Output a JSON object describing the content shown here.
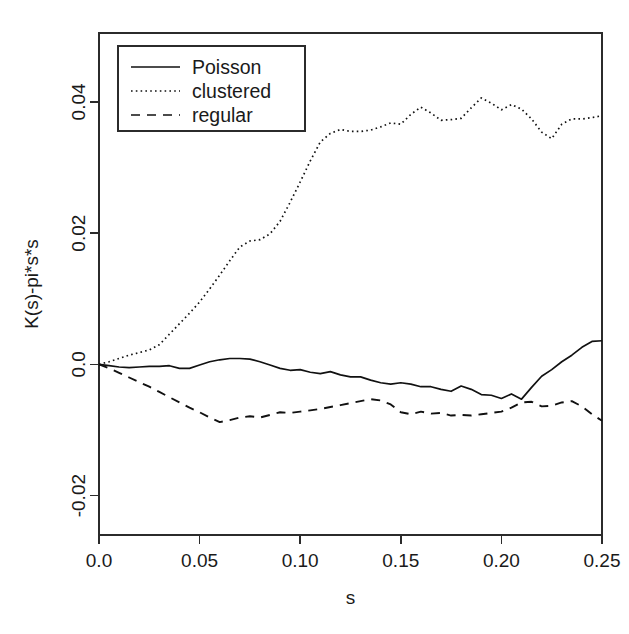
{
  "chart_data": {
    "type": "line",
    "title": "",
    "xlabel": "s",
    "ylabel": "K(s)-pi*s*s",
    "xlim": [
      0.0,
      0.25
    ],
    "ylim": [
      -0.026,
      0.0505
    ],
    "grid": false,
    "legend_position": "top-left",
    "xticks": [
      0.0,
      0.05,
      0.1,
      0.15,
      0.2,
      0.25
    ],
    "xticklabels": [
      "0.0",
      "0.05",
      "0.10",
      "0.15",
      "0.20",
      "0.25"
    ],
    "yticks": [
      -0.02,
      0.0,
      0.02,
      0.04
    ],
    "yticklabels": [
      "-0.02",
      "0.0",
      "0.02",
      "0.04"
    ],
    "series": [
      {
        "name": "Poisson",
        "style": "solid",
        "color": "#111111",
        "x": [
          0.0,
          0.005,
          0.01,
          0.015,
          0.02,
          0.025,
          0.03,
          0.035,
          0.04,
          0.045,
          0.05,
          0.055,
          0.06,
          0.065,
          0.07,
          0.075,
          0.08,
          0.085,
          0.09,
          0.095,
          0.1,
          0.105,
          0.11,
          0.115,
          0.12,
          0.125,
          0.13,
          0.135,
          0.14,
          0.145,
          0.15,
          0.155,
          0.16,
          0.165,
          0.17,
          0.175,
          0.18,
          0.185,
          0.19,
          0.195,
          0.2,
          0.205,
          0.21,
          0.215,
          0.22,
          0.225,
          0.23,
          0.235,
          0.24,
          0.245,
          0.25
        ],
        "y": [
          0.0,
          -0.0002,
          -0.0004,
          -0.0005,
          -0.0004,
          -0.0003,
          -0.0003,
          -0.0002,
          -0.0006,
          -0.0006,
          -0.0001,
          0.0004,
          0.0007,
          0.0009,
          0.0009,
          0.0008,
          0.0004,
          -0.0001,
          -0.0006,
          -0.0009,
          -0.0008,
          -0.0012,
          -0.0014,
          -0.0011,
          -0.0016,
          -0.0019,
          -0.0019,
          -0.0024,
          -0.0028,
          -0.003,
          -0.0028,
          -0.003,
          -0.0034,
          -0.0034,
          -0.0038,
          -0.0041,
          -0.0033,
          -0.0038,
          -0.0046,
          -0.0047,
          -0.0052,
          -0.0045,
          -0.0053,
          -0.0035,
          -0.0018,
          -0.0008,
          0.0004,
          0.0014,
          0.0026,
          0.0035,
          0.0036
        ]
      },
      {
        "name": "clustered",
        "style": "dotted",
        "color": "#111111",
        "x": [
          0.0,
          0.005,
          0.01,
          0.015,
          0.02,
          0.025,
          0.03,
          0.035,
          0.04,
          0.045,
          0.05,
          0.055,
          0.06,
          0.065,
          0.07,
          0.075,
          0.08,
          0.085,
          0.09,
          0.095,
          0.1,
          0.105,
          0.11,
          0.115,
          0.12,
          0.125,
          0.13,
          0.135,
          0.14,
          0.145,
          0.15,
          0.155,
          0.16,
          0.165,
          0.17,
          0.175,
          0.18,
          0.185,
          0.19,
          0.195,
          0.2,
          0.205,
          0.21,
          0.215,
          0.22,
          0.225,
          0.23,
          0.235,
          0.24,
          0.245,
          0.25
        ],
        "y": [
          0.0,
          0.0004,
          0.0009,
          0.0014,
          0.0018,
          0.0022,
          0.003,
          0.0046,
          0.0062,
          0.0078,
          0.0095,
          0.0115,
          0.0136,
          0.0158,
          0.0179,
          0.0188,
          0.019,
          0.0199,
          0.0218,
          0.0247,
          0.0278,
          0.031,
          0.0339,
          0.0352,
          0.0358,
          0.0355,
          0.0355,
          0.0357,
          0.0362,
          0.0368,
          0.0366,
          0.0381,
          0.0392,
          0.0383,
          0.0372,
          0.0373,
          0.0375,
          0.0391,
          0.0406,
          0.0398,
          0.0388,
          0.0396,
          0.0389,
          0.0374,
          0.0354,
          0.0344,
          0.0366,
          0.0374,
          0.0374,
          0.0376,
          0.0379
        ]
      },
      {
        "name": "regular",
        "style": "dashed",
        "color": "#111111",
        "x": [
          0.0,
          0.005,
          0.01,
          0.015,
          0.02,
          0.025,
          0.03,
          0.035,
          0.04,
          0.045,
          0.05,
          0.055,
          0.06,
          0.065,
          0.07,
          0.075,
          0.08,
          0.085,
          0.09,
          0.095,
          0.1,
          0.105,
          0.11,
          0.115,
          0.12,
          0.125,
          0.13,
          0.135,
          0.14,
          0.145,
          0.15,
          0.155,
          0.16,
          0.165,
          0.17,
          0.175,
          0.18,
          0.185,
          0.19,
          0.195,
          0.2,
          0.205,
          0.21,
          0.215,
          0.22,
          0.225,
          0.23,
          0.235,
          0.24,
          0.245,
          0.25
        ],
        "y": [
          0.0,
          -0.0006,
          -0.0013,
          -0.002,
          -0.0027,
          -0.0034,
          -0.0042,
          -0.005,
          -0.0058,
          -0.0066,
          -0.0073,
          -0.0081,
          -0.0088,
          -0.0085,
          -0.0081,
          -0.0079,
          -0.0081,
          -0.0077,
          -0.0073,
          -0.0074,
          -0.0072,
          -0.007,
          -0.0068,
          -0.0065,
          -0.0062,
          -0.0059,
          -0.0056,
          -0.0053,
          -0.0055,
          -0.0061,
          -0.0073,
          -0.0076,
          -0.0072,
          -0.0075,
          -0.0074,
          -0.0078,
          -0.0077,
          -0.0078,
          -0.0076,
          -0.0074,
          -0.0072,
          -0.0066,
          -0.0058,
          -0.0057,
          -0.0064,
          -0.0063,
          -0.0058,
          -0.0056,
          -0.0064,
          -0.0076,
          -0.0086
        ]
      }
    ]
  },
  "legend": {
    "entries": [
      {
        "label": "Poisson",
        "style": "solid"
      },
      {
        "label": "clustered",
        "style": "dotted"
      },
      {
        "label": "regular",
        "style": "dashed"
      }
    ]
  }
}
